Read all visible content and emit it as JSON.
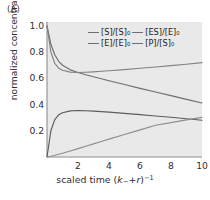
{
  "panel": {
    "label": "(A)"
  },
  "chart_data": {
    "type": "line",
    "title": "",
    "xlabel": "scaled time (k₋+r)⁻¹",
    "ylabel": "normalized concentration",
    "xlim": [
      0,
      10
    ],
    "ylim": [
      0,
      1.03
    ],
    "xticks": [
      "2",
      "4",
      "6",
      "8",
      "10"
    ],
    "xtick_values": [
      2,
      4,
      6,
      8,
      10
    ],
    "yticks": [
      "0.2",
      "0.4",
      "0.6",
      "0.8",
      "1.0"
    ],
    "ytick_values": [
      0.2,
      0.4,
      0.6,
      0.8,
      1.0
    ],
    "grid": false,
    "legend_position": "top-center",
    "background": "#e9e9e9",
    "x": [
      0,
      0.25,
      0.5,
      0.75,
      1,
      1.5,
      2,
      2.5,
      3,
      3.5,
      4,
      5,
      6,
      7,
      8,
      9,
      10
    ],
    "series": [
      {
        "name": "[S]/[S]₀",
        "color": "#6f6f6f",
        "values": [
          1.0,
          0.86,
          0.78,
          0.73,
          0.7,
          0.665,
          0.645,
          0.628,
          0.612,
          0.597,
          0.582,
          0.553,
          0.524,
          0.496,
          0.468,
          0.44,
          0.412
        ]
      },
      {
        "name": "[E]/[E]₀",
        "color": "#828282",
        "values": [
          1.0,
          0.8,
          0.715,
          0.678,
          0.662,
          0.648,
          0.645,
          0.647,
          0.65,
          0.654,
          0.658,
          0.667,
          0.677,
          0.687,
          0.697,
          0.708,
          0.72
        ]
      },
      {
        "name": "[ES]/[E]₀",
        "color": "#5c5c5c",
        "values": [
          0.0,
          0.2,
          0.285,
          0.322,
          0.338,
          0.352,
          0.355,
          0.353,
          0.35,
          0.346,
          0.342,
          0.333,
          0.323,
          0.313,
          0.303,
          0.292,
          0.28
        ]
      },
      {
        "name": "[P]/[S]₀",
        "color": "#8e8e8e",
        "values": [
          0.0,
          0.006,
          0.013,
          0.021,
          0.029,
          0.046,
          0.064,
          0.082,
          0.1,
          0.118,
          0.136,
          0.172,
          0.207,
          0.242,
          0.262,
          0.283,
          0.302
        ]
      }
    ]
  },
  "legend": {
    "entries": [
      "[S]/[S]₀",
      "[ES]/[E]₀",
      "[E]/[E]₀",
      "[P]/[S]₀"
    ]
  }
}
